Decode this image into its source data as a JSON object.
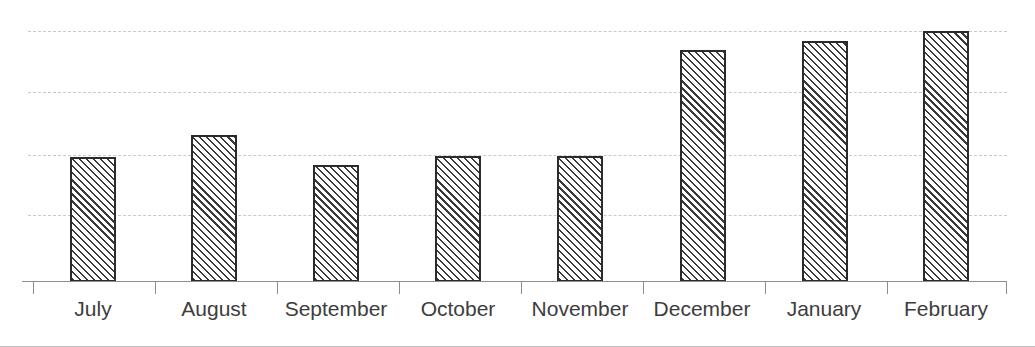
{
  "chart_data": {
    "type": "bar",
    "title": "",
    "subtitle": "",
    "xlabel": "",
    "ylabel": "",
    "categories": [
      "July",
      "August",
      "September",
      "October",
      "November",
      "December",
      "January",
      "February"
    ],
    "values": [
      50,
      59,
      47,
      50,
      50,
      92,
      96,
      100
    ],
    "series": [
      {
        "name": "",
        "values": [
          50,
          59,
          47,
          50,
          50,
          92,
          96,
          100
        ]
      }
    ],
    "ylim": [
      0,
      100
    ],
    "yticks": [
      25,
      50,
      75,
      100
    ],
    "ytick_labels": [
      "",
      "",
      "",
      ""
    ],
    "grid": true,
    "grid_axis": "y",
    "grid_style": "dashed",
    "grid_color": "#c9c9c9",
    "legend": false,
    "legend_position": "none",
    "bar_fill": "diagonal-hatch",
    "bar_fill_color": "#ffffff",
    "bar_edge_color": "#2b2b2b",
    "axis_color": "#8d8d8d",
    "label_color": "#3d3d3d",
    "background_color": "#ffffff",
    "annotations": []
  },
  "layout": {
    "bar_geometry": [
      {
        "left": 70,
        "width": 46,
        "top": 157,
        "tick": 33,
        "label_center": 93
      },
      {
        "left": 191,
        "width": 46,
        "top": 135,
        "tick": 155,
        "label_center": 214
      },
      {
        "left": 313,
        "width": 46,
        "top": 165,
        "tick": 277,
        "label_center": 336
      },
      {
        "left": 435,
        "width": 46,
        "top": 156,
        "tick": 399,
        "label_center": 458
      },
      {
        "left": 557,
        "width": 46,
        "top": 156,
        "tick": 521,
        "label_center": 580
      },
      {
        "left": 680,
        "width": 46,
        "top": 50,
        "tick": 643,
        "label_center": 702
      },
      {
        "left": 802,
        "width": 46,
        "top": 41,
        "tick": 765,
        "label_center": 824
      },
      {
        "left": 923,
        "width": 46,
        "top": 31,
        "tick": 887,
        "label_center": 946
      }
    ],
    "gridline_y": [
      31,
      92,
      155,
      215
    ],
    "baseline_y": 282
  }
}
